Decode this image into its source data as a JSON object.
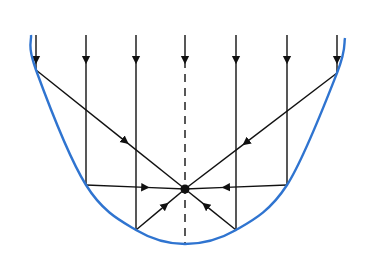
{
  "diagram": {
    "colors": {
      "mirror": "#2f74d0",
      "rays": "#111111",
      "background": "#ffffff"
    },
    "mirror": {
      "points": [
        [
          31,
          35
        ],
        [
          36,
          70
        ],
        [
          86,
          185
        ],
        [
          136,
          230
        ],
        [
          185,
          244
        ],
        [
          236,
          230
        ],
        [
          287,
          185
        ],
        [
          337,
          73
        ],
        [
          345,
          38
        ]
      ]
    },
    "focus": {
      "x": 185,
      "y": 189,
      "r": 4.5
    },
    "axis": {
      "x": 185,
      "y1": 35,
      "y2": 244,
      "style": "dashed"
    },
    "incident_rays": [
      {
        "x": 36,
        "y_top": 35,
        "hit_y": 70
      },
      {
        "x": 86,
        "y_top": 35,
        "hit_y": 185
      },
      {
        "x": 136,
        "y_top": 35,
        "hit_y": 230
      },
      {
        "x": 185,
        "y_top": 35,
        "hit_y": 189
      },
      {
        "x": 236,
        "y_top": 35,
        "hit_y": 230
      },
      {
        "x": 287,
        "y_top": 35,
        "hit_y": 185
      },
      {
        "x": 337,
        "y_top": 35,
        "hit_y": 73
      }
    ],
    "arrow_y": 60,
    "reflected_rays": [
      {
        "from": [
          36,
          70
        ],
        "to": [
          185,
          189
        ]
      },
      {
        "from": [
          86,
          185
        ],
        "to": [
          185,
          189
        ]
      },
      {
        "from": [
          136,
          230
        ],
        "to": [
          185,
          189
        ]
      },
      {
        "from": [
          236,
          230
        ],
        "to": [
          185,
          189
        ]
      },
      {
        "from": [
          287,
          185
        ],
        "to": [
          185,
          189
        ]
      },
      {
        "from": [
          337,
          73
        ],
        "to": [
          185,
          189
        ]
      }
    ],
    "extensions": [
      {
        "from": [
          185,
          189
        ],
        "to": [
          236,
          230
        ],
        "note": "reflected lines pass through focus"
      }
    ]
  }
}
